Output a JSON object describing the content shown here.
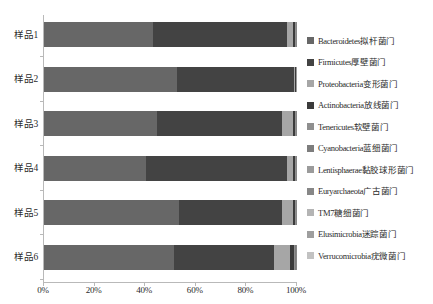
{
  "chart_data": {
    "type": "bar",
    "title": "",
    "xlabel": "",
    "ylabel": "",
    "orientation": "horizontal",
    "stacked": true,
    "normalized": true,
    "grid": false,
    "legend_position": "right",
    "xlim": [
      0,
      100
    ],
    "xticks": [
      "0%",
      "20%",
      "40%",
      "60%",
      "80%",
      "100%"
    ],
    "xtick_values": [
      0,
      20,
      40,
      60,
      80,
      100
    ],
    "categories": [
      "样品1",
      "样品2",
      "样品3",
      "样品4",
      "样品5",
      "样品6"
    ],
    "series": [
      {
        "name": "Bacteroidetes拟杆菌门",
        "color": "#676767",
        "values": [
          43.0,
          52.5,
          44.5,
          40.5,
          53.5,
          51.5
        ]
      },
      {
        "name": "Firmicutes厚壁菌门",
        "color": "#434343",
        "values": [
          53.0,
          46.3,
          49.5,
          55.5,
          40.5,
          39.5
        ]
      },
      {
        "name": "Proteobacteria变形菌门",
        "color": "#a6a6a6",
        "values": [
          2.6,
          0.4,
          4.6,
          2.6,
          4.6,
          6.3
        ]
      },
      {
        "name": "Actinobacteria放线菌门",
        "color": "#3b3b3b",
        "values": [
          0.6,
          0.3,
          0.6,
          0.6,
          0.6,
          1.6
        ]
      },
      {
        "name": "Tenericutes软壁菌门",
        "color": "#8f8f8f",
        "values": [
          0.35,
          0.2,
          0.35,
          0.35,
          0.35,
          0.5
        ]
      },
      {
        "name": "Cyanobacteria蓝细菌门",
        "color": "#7d7d7d",
        "values": [
          0.15,
          0.1,
          0.15,
          0.15,
          0.15,
          0.2
        ]
      },
      {
        "name": "Lentisphaerae黏胶球形菌门",
        "color": "#9b9b9b",
        "values": [
          0.1,
          0.07,
          0.1,
          0.1,
          0.1,
          0.15
        ]
      },
      {
        "name": "Euryarchaeota广古菌门",
        "color": "#878787",
        "values": [
          0.08,
          0.05,
          0.08,
          0.08,
          0.08,
          0.1
        ]
      },
      {
        "name": "TM7糖细菌门",
        "color": "#b4b4b4",
        "values": [
          0.06,
          0.04,
          0.06,
          0.06,
          0.06,
          0.08
        ]
      },
      {
        "name": "Elusimicrobia迷踪菌门",
        "color": "#9e9e9e",
        "values": [
          0.05,
          0.03,
          0.05,
          0.05,
          0.05,
          0.06
        ]
      },
      {
        "name": "Verrucomicrobia疣微菌门",
        "color": "#c2c2c2",
        "values": [
          0.05,
          0.01,
          0.05,
          0.05,
          0.05,
          0.01
        ]
      }
    ]
  },
  "axis": {
    "line_color": "#b9b9b9"
  }
}
